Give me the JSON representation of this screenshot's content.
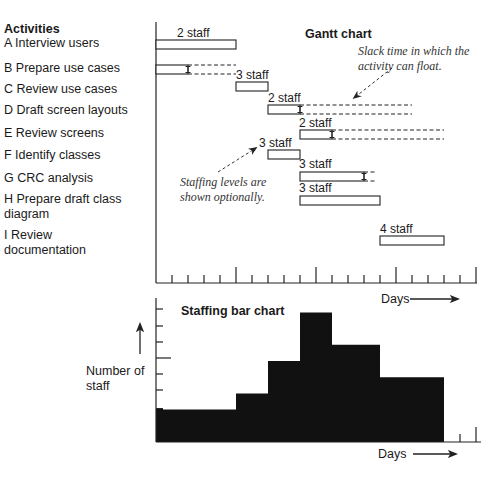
{
  "chart_data": [
    {
      "type": "gantt",
      "title": "Gantt chart",
      "activities_header": "Activities",
      "xlabel": "Days",
      "tick_unit_px": 16,
      "axis": {
        "x0": 156,
        "x_end": 477,
        "y_top": 22,
        "y_base": 283,
        "ticks": 20,
        "major_every": 5
      },
      "activities": [
        {
          "id": "A",
          "label_lines": [
            "A Interview users"
          ],
          "label_y": [
            47
          ],
          "start": 0,
          "end": 5,
          "slack_end": null,
          "staff": 2,
          "staff_label": "2 staff",
          "bar_y": 40,
          "staff_label_x": 177,
          "staff_label_y": 37
        },
        {
          "id": "B",
          "label_lines": [
            "B Prepare use cases"
          ],
          "label_y": [
            72
          ],
          "start": 0,
          "end": 2,
          "slack_end": 5,
          "staff": 3,
          "staff_label": "3 staff",
          "bar_y": 65,
          "staff_label_x": 236,
          "staff_label_y": 79
        },
        {
          "id": "C",
          "label_lines": [
            "C Review use cases"
          ],
          "label_y": [
            93
          ],
          "start": 5,
          "end": 7,
          "slack_end": null,
          "staff": null,
          "staff_label": null,
          "bar_y": 82
        },
        {
          "id": "D",
          "label_lines": [
            "D Draft screen layouts"
          ],
          "label_y": [
            114
          ],
          "start": 7,
          "end": 9,
          "slack_end": 16,
          "staff": 2,
          "staff_label": "2 staff",
          "bar_y": 105,
          "staff_label_x": 268,
          "staff_label_y": 102
        },
        {
          "id": "E",
          "label_lines": [
            "E Review screens"
          ],
          "label_y": [
            137
          ],
          "start": 9,
          "end": 11,
          "slack_end": 18,
          "staff": 2,
          "staff_label": "2 staff",
          "bar_y": 130,
          "staff_label_x": 299,
          "staff_label_y": 127
        },
        {
          "id": "F",
          "label_lines": [
            "F Identify classes"
          ],
          "label_y": [
            159
          ],
          "start": 7,
          "end": 9,
          "slack_end": null,
          "staff": 3,
          "staff_label": "3 staff",
          "bar_y": 150,
          "staff_label_x": 259,
          "staff_label_y": 147
        },
        {
          "id": "G",
          "label_lines": [
            "G CRC analysis"
          ],
          "label_y": [
            182
          ],
          "start": 9,
          "end": 13,
          "slack_end": 13.75,
          "staff": 3,
          "staff_label": "3 staff",
          "bar_y": 172,
          "staff_label_x": 299,
          "staff_label_y": 168
        },
        {
          "id": "H",
          "label_lines": [
            "H Prepare draft class",
            "diagram"
          ],
          "label_y": [
            203,
            218
          ],
          "start": 9,
          "end": 14,
          "slack_end": null,
          "staff": 3,
          "staff_label": "3 staff",
          "bar_y": 196,
          "staff_label_x": 299,
          "staff_label_y": 192
        },
        {
          "id": "I",
          "label_lines": [
            "I Review",
            "documentation"
          ],
          "label_y": [
            239,
            254
          ],
          "start": 14,
          "end": 18,
          "slack_end": null,
          "staff": 4,
          "staff_label": "4 staff",
          "bar_y": 236,
          "staff_label_x": 380,
          "staff_label_y": 233
        }
      ],
      "annotations": [
        {
          "lines": [
            "Slack time in which the",
            "activity can float."
          ],
          "x": 358,
          "y": [
            55,
            70
          ],
          "arrow_from": [
            392,
            68
          ],
          "arrow_to": [
            354,
            98
          ]
        },
        {
          "lines": [
            "Staffing levels are",
            "shown optionally."
          ],
          "x": 180,
          "y": [
            186,
            201
          ],
          "arrow_from": [
            218,
            172
          ],
          "arrow_to": [
            256,
            148
          ]
        }
      ]
    },
    {
      "type": "area",
      "title": "Staffing bar chart",
      "xlabel": "Days",
      "ylabel_lines": [
        "Number of",
        "staff"
      ],
      "axis": {
        "x0": 156,
        "x_end": 481,
        "y_top": 298,
        "y_base": 442,
        "unit_px": 16.2,
        "y_ticks": [
          309,
          326,
          342,
          358,
          374,
          390
        ],
        "y_major_tick": 358,
        "x_ticks": [
          460,
          476
        ]
      },
      "steps": [
        {
          "from_day": 0,
          "to_day": 5,
          "staff": 2
        },
        {
          "from_day": 5,
          "to_day": 7,
          "staff": 3
        },
        {
          "from_day": 7,
          "to_day": 9,
          "staff": 5
        },
        {
          "from_day": 9,
          "to_day": 11,
          "staff": 8
        },
        {
          "from_day": 11,
          "to_day": 14,
          "staff": 6
        },
        {
          "from_day": 14,
          "to_day": 18,
          "staff": 4
        }
      ],
      "ylim": [
        0,
        8
      ]
    }
  ],
  "text": {
    "activities_header": "Activities",
    "gantt_title": "Gantt chart",
    "gantt_xlabel": "Days",
    "staff_title": "Staffing bar chart",
    "staff_xlabel": "Days",
    "staff_ylabel_1": "Number of",
    "staff_ylabel_2": "staff"
  }
}
